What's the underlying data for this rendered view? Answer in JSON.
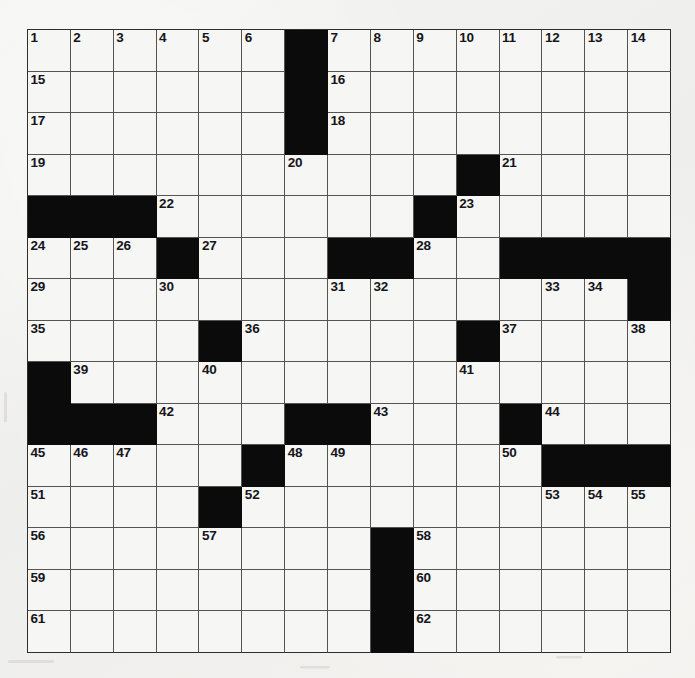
{
  "puzzle": {
    "kind": "crossword-grid",
    "rows": 15,
    "columns": 15,
    "grid_colors": {
      "paper": "#f1f1ef",
      "cell_fill": "#f6f6f4",
      "block_fill": "#0b0b0b",
      "grid_line": "#555452",
      "border": "#2e2e2e",
      "number_text": "#15151a"
    },
    "highest_number": 62,
    "block_count": 60,
    "blocks": [
      [
        0,
        6
      ],
      [
        1,
        6
      ],
      [
        2,
        6
      ],
      [
        3,
        10
      ],
      [
        4,
        0
      ],
      [
        4,
        1
      ],
      [
        4,
        2
      ],
      [
        4,
        9
      ],
      [
        5,
        3
      ],
      [
        5,
        7
      ],
      [
        5,
        8
      ],
      [
        5,
        11
      ],
      [
        5,
        12
      ],
      [
        5,
        13
      ],
      [
        5,
        14
      ],
      [
        6,
        14
      ],
      [
        7,
        4
      ],
      [
        7,
        10
      ],
      [
        8,
        0
      ],
      [
        9,
        0
      ],
      [
        9,
        1
      ],
      [
        9,
        2
      ],
      [
        9,
        6
      ],
      [
        9,
        7
      ],
      [
        9,
        11
      ],
      [
        10,
        5
      ],
      [
        10,
        12
      ],
      [
        10,
        13
      ],
      [
        10,
        14
      ],
      [
        11,
        4
      ],
      [
        12,
        8
      ],
      [
        13,
        8
      ],
      [
        14,
        8
      ]
    ],
    "numbers": [
      {
        "row": 0,
        "col": 0,
        "n": "1"
      },
      {
        "row": 0,
        "col": 1,
        "n": "2"
      },
      {
        "row": 0,
        "col": 2,
        "n": "3"
      },
      {
        "row": 0,
        "col": 3,
        "n": "4"
      },
      {
        "row": 0,
        "col": 4,
        "n": "5"
      },
      {
        "row": 0,
        "col": 5,
        "n": "6"
      },
      {
        "row": 0,
        "col": 7,
        "n": "7"
      },
      {
        "row": 0,
        "col": 8,
        "n": "8"
      },
      {
        "row": 0,
        "col": 9,
        "n": "9"
      },
      {
        "row": 0,
        "col": 10,
        "n": "10"
      },
      {
        "row": 0,
        "col": 11,
        "n": "11"
      },
      {
        "row": 0,
        "col": 12,
        "n": "12"
      },
      {
        "row": 0,
        "col": 13,
        "n": "13"
      },
      {
        "row": 0,
        "col": 14,
        "n": "14"
      },
      {
        "row": 1,
        "col": 0,
        "n": "15"
      },
      {
        "row": 1,
        "col": 7,
        "n": "16"
      },
      {
        "row": 2,
        "col": 0,
        "n": "17"
      },
      {
        "row": 2,
        "col": 7,
        "n": "18"
      },
      {
        "row": 3,
        "col": 0,
        "n": "19"
      },
      {
        "row": 3,
        "col": 6,
        "n": "20"
      },
      {
        "row": 3,
        "col": 11,
        "n": "21"
      },
      {
        "row": 4,
        "col": 3,
        "n": "22"
      },
      {
        "row": 4,
        "col": 10,
        "n": "23"
      },
      {
        "row": 5,
        "col": 0,
        "n": "24"
      },
      {
        "row": 5,
        "col": 1,
        "n": "25"
      },
      {
        "row": 5,
        "col": 2,
        "n": "26"
      },
      {
        "row": 5,
        "col": 4,
        "n": "27"
      },
      {
        "row": 5,
        "col": 9,
        "n": "28"
      },
      {
        "row": 6,
        "col": 0,
        "n": "29"
      },
      {
        "row": 6,
        "col": 3,
        "n": "30"
      },
      {
        "row": 6,
        "col": 7,
        "n": "31"
      },
      {
        "row": 6,
        "col": 8,
        "n": "32"
      },
      {
        "row": 6,
        "col": 12,
        "n": "33"
      },
      {
        "row": 6,
        "col": 13,
        "n": "34"
      },
      {
        "row": 7,
        "col": 0,
        "n": "35"
      },
      {
        "row": 7,
        "col": 5,
        "n": "36"
      },
      {
        "row": 7,
        "col": 11,
        "n": "37"
      },
      {
        "row": 7,
        "col": 14,
        "n": "38"
      },
      {
        "row": 8,
        "col": 1,
        "n": "39"
      },
      {
        "row": 8,
        "col": 4,
        "n": "40"
      },
      {
        "row": 8,
        "col": 10,
        "n": "41"
      },
      {
        "row": 9,
        "col": 3,
        "n": "42"
      },
      {
        "row": 9,
        "col": 8,
        "n": "43"
      },
      {
        "row": 9,
        "col": 12,
        "n": "44"
      },
      {
        "row": 10,
        "col": 0,
        "n": "45"
      },
      {
        "row": 10,
        "col": 1,
        "n": "46"
      },
      {
        "row": 10,
        "col": 2,
        "n": "47"
      },
      {
        "row": 10,
        "col": 6,
        "n": "48"
      },
      {
        "row": 10,
        "col": 7,
        "n": "49"
      },
      {
        "row": 10,
        "col": 11,
        "n": "50"
      },
      {
        "row": 11,
        "col": 0,
        "n": "51"
      },
      {
        "row": 11,
        "col": 5,
        "n": "52"
      },
      {
        "row": 11,
        "col": 12,
        "n": "53"
      },
      {
        "row": 11,
        "col": 13,
        "n": "54"
      },
      {
        "row": 11,
        "col": 14,
        "n": "55"
      },
      {
        "row": 12,
        "col": 0,
        "n": "56"
      },
      {
        "row": 12,
        "col": 4,
        "n": "57"
      },
      {
        "row": 12,
        "col": 9,
        "n": "58"
      },
      {
        "row": 13,
        "col": 0,
        "n": "59"
      },
      {
        "row": 13,
        "col": 9,
        "n": "60"
      },
      {
        "row": 14,
        "col": 0,
        "n": "61"
      },
      {
        "row": 14,
        "col": 9,
        "n": "62"
      }
    ],
    "letters": []
  }
}
